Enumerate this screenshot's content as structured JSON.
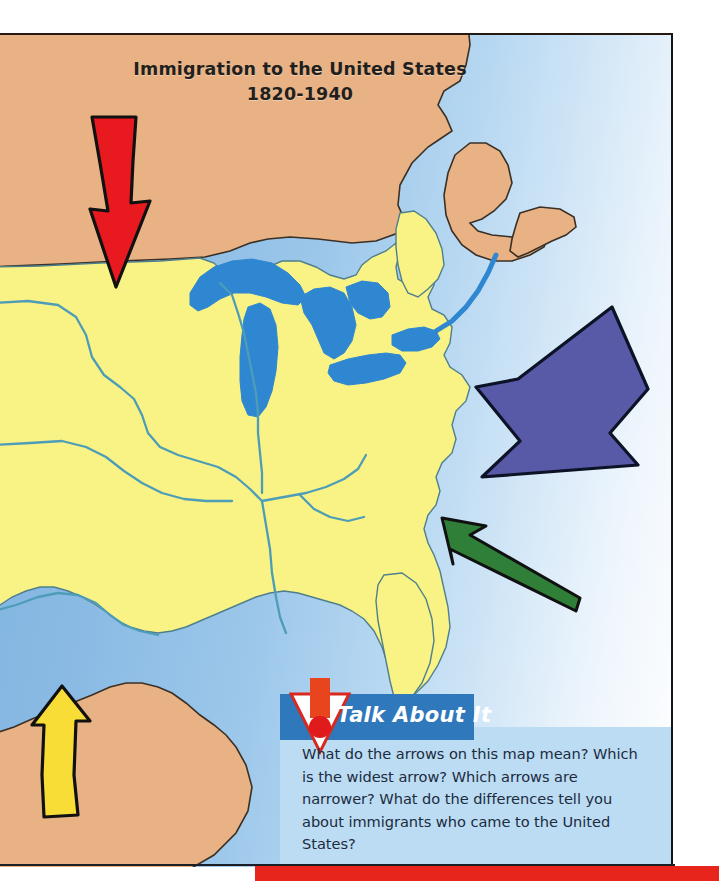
{
  "map": {
    "title_line1": "Immigration to the United States",
    "title_line2": "1820-1940",
    "colors": {
      "united_states": "#f7f282",
      "neighbor_land": "#e8b183",
      "ocean_near": "#7cb2e0",
      "lakes": "#2e86d0",
      "rivers": "#4a9bbd",
      "outline": "#2a2e33",
      "red_bar": "#e8251c"
    },
    "arrows": [
      {
        "name": "red-arrow-from-canada",
        "color": "#e8191f",
        "direction": "south",
        "width_label": "medium",
        "origin": "Canada / north"
      },
      {
        "name": "blue-arrow-from-europe",
        "color": "#5457a6",
        "direction": "southwest",
        "width_label": "widest",
        "origin": "Atlantic Ocean / Europe"
      },
      {
        "name": "green-arrow-from-atlantic",
        "color": "#2f7f38",
        "direction": "northwest",
        "width_label": "narrowest",
        "origin": "Atlantic Ocean / south"
      },
      {
        "name": "yellow-arrow-from-mexico",
        "color": "#f7dd32",
        "direction": "north",
        "width_label": "medium",
        "origin": "Mexico / south"
      }
    ]
  },
  "callout": {
    "icon": "exclamation-triangle-icon",
    "title": "Talk About It",
    "text": "What do the arrows on this map mean? Which is the widest arrow? Which arrows are narrower? What do the differences tell you about immigrants who came to the United States?"
  }
}
